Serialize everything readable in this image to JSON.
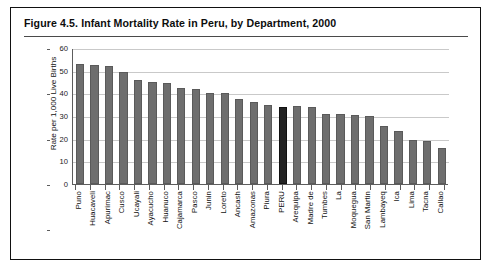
{
  "figure": {
    "title": "Figure 4.5.  Infant Mortality Rate in Peru, by Department, 2000",
    "border_color": "#111111",
    "bar_color": "#6e6e6e",
    "highlight_color": "#232323",
    "gridline_color": "#c9c9c9"
  },
  "chart_data": {
    "type": "bar",
    "title": "Infant Mortality Rate in Peru, by Department, 2000",
    "xlabel": "",
    "ylabel": "Rate per 1,000 Live Births",
    "ylim": [
      0,
      60
    ],
    "yticks": [
      0,
      10,
      20,
      30,
      40,
      50,
      60
    ],
    "ytick_labels": [
      "0",
      "10",
      "20",
      "30",
      "40",
      "50",
      "60"
    ],
    "grid": "horizontal",
    "legend": "none",
    "highlight_category": "PERU",
    "categories": [
      "Puno",
      "Huacaveli",
      "Apurimac",
      "Cusco",
      "Ucayali",
      "Ayacucho",
      "Huanuco",
      "Cajamarca",
      "Pasco",
      "Junin",
      "Loreto",
      "Ancash",
      "Amazonas",
      "Piura",
      "PERU",
      "Arequipa",
      "Madre de",
      "Tumbes",
      "La",
      "Moquegua",
      "San Martin",
      "Lambayeq",
      "Ica",
      "Lima",
      "Tacna",
      "Callao"
    ],
    "values": [
      53,
      52.5,
      52,
      49.5,
      46,
      45,
      44.5,
      42.5,
      42,
      40,
      40,
      37.5,
      36,
      35,
      34,
      34.5,
      34,
      31,
      31,
      30.5,
      30,
      25.5,
      23.5,
      19.5,
      19,
      16
    ]
  }
}
